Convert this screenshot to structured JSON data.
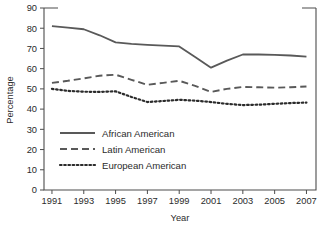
{
  "chart_data": {
    "type": "line",
    "title": "",
    "xlabel": "Year",
    "ylabel": "Percentage",
    "x": [
      1991,
      1992,
      1993,
      1994,
      1995,
      1996,
      1997,
      1998,
      1999,
      2000,
      2001,
      2002,
      2003,
      2004,
      2005,
      2006,
      2007
    ],
    "xticks": [
      "1991",
      "1993",
      "1995",
      "1997",
      "1999",
      "2001",
      "2003",
      "2005",
      "2007"
    ],
    "xtick_values": [
      1991,
      1993,
      1995,
      1997,
      1999,
      2001,
      2003,
      2005,
      2007
    ],
    "yticks": [
      "0",
      "10",
      "20",
      "30",
      "40",
      "50",
      "60",
      "70",
      "80",
      "90"
    ],
    "ytick_values": [
      0,
      10,
      20,
      30,
      40,
      50,
      60,
      70,
      80,
      90
    ],
    "xlim": [
      1990.5,
      2007.6
    ],
    "ylim": [
      0,
      90
    ],
    "grid": false,
    "legend_position": "inside-lower-left",
    "series": [
      {
        "name": "African American",
        "style": "solid",
        "color": "#595959",
        "values": [
          81.0,
          80.3,
          79.5,
          76.5,
          73.0,
          72.3,
          71.8,
          71.4,
          71.0,
          65.8,
          60.5,
          64.0,
          67.0,
          67.0,
          66.8,
          66.5,
          66.0
        ]
      },
      {
        "name": "Latin American",
        "style": "dashed",
        "color": "#595959",
        "values": [
          53.0,
          54.0,
          55.2,
          56.5,
          57.0,
          54.5,
          52.0,
          53.0,
          54.0,
          51.5,
          48.5,
          50.0,
          51.0,
          50.8,
          50.6,
          50.8,
          51.2
        ]
      },
      {
        "name": "European American",
        "style": "dotted",
        "color": "#2b2b2b",
        "values": [
          50.0,
          49.0,
          48.6,
          48.5,
          48.8,
          46.0,
          43.5,
          44.0,
          44.6,
          44.2,
          43.5,
          42.6,
          42.0,
          42.2,
          42.6,
          43.0,
          43.2
        ]
      }
    ]
  },
  "axis": {
    "y_title": "Percentage",
    "x_title": "Year"
  },
  "legend": {
    "items": [
      {
        "label": "African American",
        "style": "solid"
      },
      {
        "label": "Latin American",
        "style": "dashed"
      },
      {
        "label": "European American",
        "style": "dotted"
      }
    ]
  },
  "caption": {
    "text": ""
  },
  "colors": {
    "axis": "#4d4d4d",
    "solid_series": "#595959",
    "dashed_series": "#595959",
    "dotted_series": "#2b2b2b",
    "text": "#2b2b2b",
    "background": "#ffffff"
  }
}
